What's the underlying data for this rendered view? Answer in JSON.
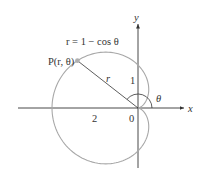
{
  "diagram": {
    "equation_label": "r = 1 − cos θ",
    "point_label": "P(r, θ)",
    "radius_label": "r",
    "angle_label": "θ",
    "x_axis_label": "x",
    "y_axis_label": "y",
    "tick_labels": {
      "x_neg_2": "2",
      "origin": "0",
      "y_1": "1"
    },
    "curve": {
      "type": "cardioid",
      "polar_equation": "r = 1 - cos(theta)",
      "color": "#a8a8a8"
    },
    "point": {
      "theta_deg": 142,
      "color": "#a8a8a8"
    },
    "colors": {
      "axes": "#333333",
      "curve": "#a8a8a8",
      "angle_arc": "#333333",
      "text": "#333333"
    }
  }
}
